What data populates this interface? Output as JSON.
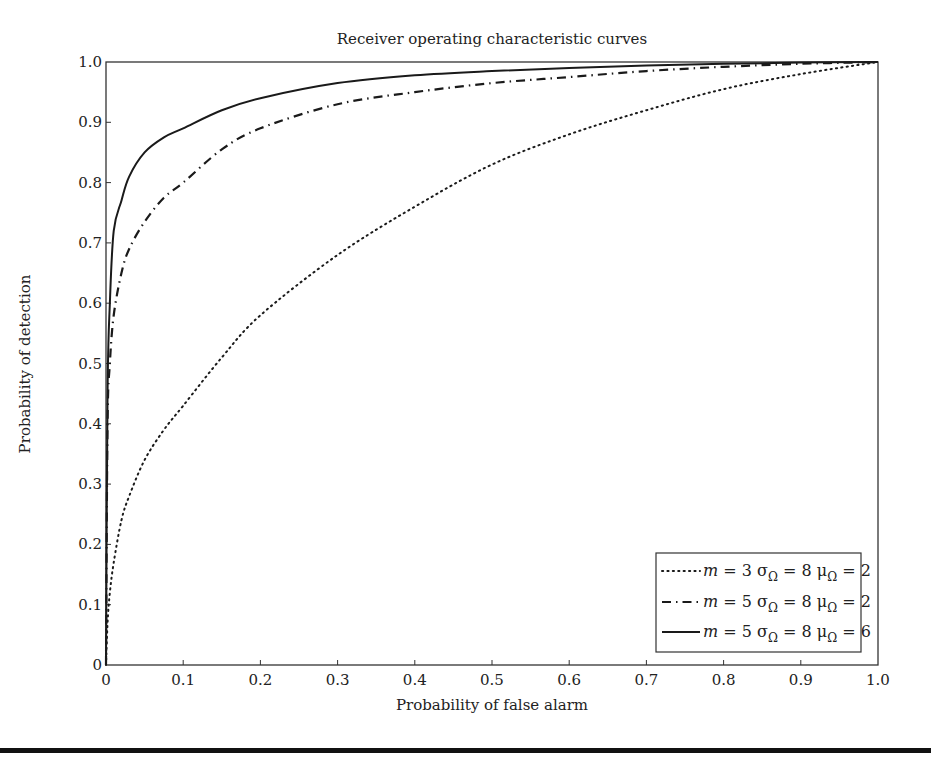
{
  "chart_data": {
    "type": "line",
    "title": "Receiver operating characteristic curves",
    "xlabel": "Probability of false alarm",
    "ylabel": "Probability of detection",
    "xlim": [
      0,
      1.0
    ],
    "ylim": [
      0,
      1.0
    ],
    "grid": false,
    "legend_position": "lower right",
    "x_ticks": [
      "0",
      "0.1",
      "0.2",
      "0.3",
      "0.4",
      "0.5",
      "0.6",
      "0.7",
      "0.8",
      "0.9",
      "1.0"
    ],
    "y_ticks": [
      "0",
      "0.1",
      "0.2",
      "0.3",
      "0.4",
      "0.5",
      "0.6",
      "0.7",
      "0.8",
      "0.9",
      "1.0"
    ],
    "x": [
      0,
      0.002,
      0.005,
      0.01,
      0.02,
      0.03,
      0.05,
      0.075,
      0.1,
      0.15,
      0.2,
      0.3,
      0.4,
      0.5,
      0.6,
      0.7,
      0.8,
      0.9,
      1.0
    ],
    "series": [
      {
        "name": "m = 3 σΩ = 8 μΩ = 2",
        "style": "dotted",
        "values": [
          0,
          0.07,
          0.12,
          0.17,
          0.24,
          0.28,
          0.34,
          0.39,
          0.43,
          0.51,
          0.58,
          0.68,
          0.76,
          0.83,
          0.88,
          0.92,
          0.955,
          0.98,
          1.0
        ]
      },
      {
        "name": "m = 5 σΩ = 8 μΩ = 2",
        "style": "dash-dot",
        "values": [
          0,
          0.4,
          0.5,
          0.58,
          0.65,
          0.69,
          0.735,
          0.775,
          0.8,
          0.855,
          0.89,
          0.93,
          0.95,
          0.965,
          0.975,
          0.985,
          0.992,
          0.997,
          1.0
        ]
      },
      {
        "name": "m = 5 σΩ = 8 μΩ = 6",
        "style": "solid",
        "values": [
          0,
          0.45,
          0.6,
          0.72,
          0.77,
          0.81,
          0.85,
          0.875,
          0.89,
          0.92,
          0.94,
          0.965,
          0.978,
          0.985,
          0.99,
          0.994,
          0.997,
          0.999,
          1.0
        ]
      }
    ]
  },
  "legend": {
    "items": [
      {
        "m": "m",
        "m_val": "= 3",
        "sigma": "σ",
        "sigma_sub": "Ω",
        "sigma_val": "= 8",
        "mu": "μ",
        "mu_sub": "Ω",
        "mu_val": "= 2"
      },
      {
        "m": "m",
        "m_val": "= 5",
        "sigma": "σ",
        "sigma_sub": "Ω",
        "sigma_val": "= 8",
        "mu": "μ",
        "mu_sub": "Ω",
        "mu_val": "= 2"
      },
      {
        "m": "m",
        "m_val": "= 5",
        "sigma": "σ",
        "sigma_sub": "Ω",
        "sigma_val": "= 8",
        "mu": "μ",
        "mu_sub": "Ω",
        "mu_val": "= 6"
      }
    ]
  }
}
